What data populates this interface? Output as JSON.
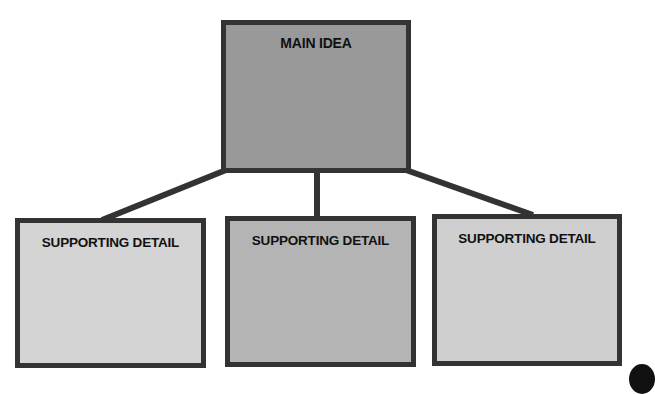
{
  "diagram": {
    "type": "tree",
    "main_idea": {
      "label": "MAIN IDEA",
      "fill": "#999999"
    },
    "supporting_details": [
      {
        "label": "SUPPORTING DETAIL",
        "fill": "#d4d4d4"
      },
      {
        "label": "SUPPORTING DETAIL",
        "fill": "#b4b4b4"
      },
      {
        "label": "SUPPORTING DETAIL",
        "fill": "#cfcfcf"
      }
    ],
    "border_color": "#333333",
    "connector_color": "#333333"
  }
}
